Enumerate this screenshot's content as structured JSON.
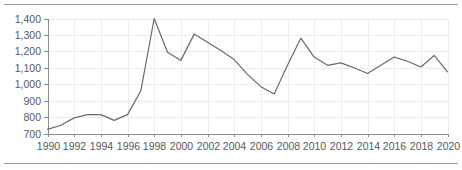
{
  "chart_data": {
    "type": "line",
    "title": "",
    "subtitle": "",
    "xlabel": "",
    "ylabel": "",
    "grid": true,
    "legend": false,
    "legend_position": "none",
    "line_color": "#6a6a6a",
    "axis_color": "#8d8d8d",
    "grid_color": "#ececf0",
    "tick_label_color": "#58595b",
    "xlim": [
      1990,
      2020
    ],
    "ylim": [
      700,
      1400
    ],
    "y_tick_step": 100,
    "x_tick_step": 2,
    "y_ticks": [
      700,
      800,
      900,
      1000,
      1100,
      1200,
      1300,
      1400
    ],
    "y_tick_labels": [
      "700",
      "800",
      "900",
      "1,000",
      "1,100",
      "1,200",
      "1,300",
      "1,400"
    ],
    "x_ticks": [
      1990,
      1992,
      1994,
      1996,
      1998,
      2000,
      2002,
      2004,
      2006,
      2008,
      2010,
      2012,
      2014,
      2016,
      2018,
      2020
    ],
    "x_tick_labels": [
      "1990",
      "1992",
      "1994",
      "1996",
      "1998",
      "2000",
      "2002",
      "2004",
      "2006",
      "2008",
      "2010",
      "2012",
      "2014",
      "2016",
      "2018",
      "2020"
    ],
    "x": [
      1990,
      1991,
      1992,
      1993,
      1994,
      1995,
      1996,
      1997,
      1998,
      1999,
      2000,
      2001,
      2002,
      2003,
      2004,
      2005,
      2006,
      2007,
      2008,
      2009,
      2010,
      2011,
      2012,
      2013,
      2014,
      2015,
      2016,
      2017,
      2018,
      2019,
      2020
    ],
    "series": [
      {
        "name": "series-1",
        "values": [
          725,
          750,
          795,
          815,
          815,
          780,
          815,
          960,
          1400,
          1195,
          1145,
          1305,
          1255,
          1205,
          1150,
          1060,
          985,
          940,
          1115,
          1280,
          1165,
          1115,
          1130,
          1100,
          1065,
          1115,
          1165,
          1140,
          1105,
          1175,
          1075
        ]
      }
    ]
  }
}
